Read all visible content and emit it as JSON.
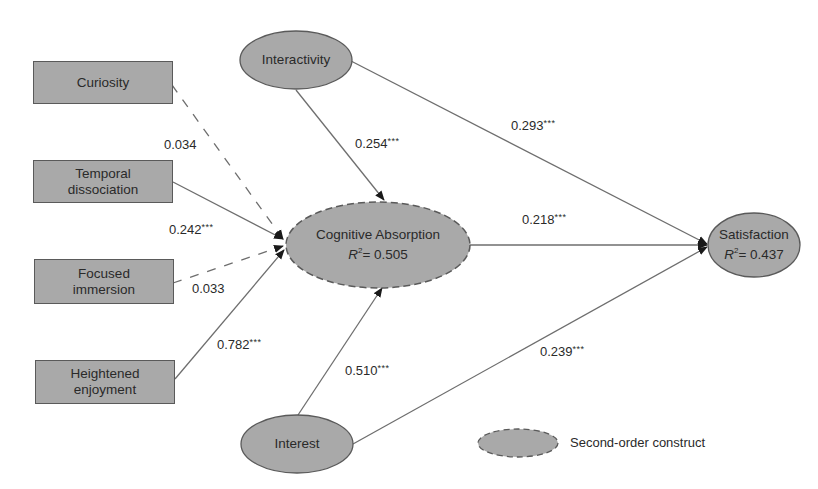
{
  "figure": {
    "type": "structural path model",
    "colors": {
      "node_fill": "#a9a9a9",
      "node_stroke": "#5a5a5a",
      "path_line": "#6e6e6e",
      "arrowhead": "#1a1a1a",
      "text": "#2a2a2a"
    }
  },
  "nodes": {
    "curiosity": {
      "label": "Curiosity",
      "shape": "rectangle"
    },
    "temporal_dissociation": {
      "line1": "Temporal",
      "line2": "dissociation",
      "shape": "rectangle"
    },
    "focused_immersion": {
      "line1": "Focused",
      "line2": "immersion",
      "shape": "rectangle"
    },
    "heightened_enjoyment": {
      "line1": "Heightened",
      "line2": "enjoyment",
      "shape": "rectangle"
    },
    "interactivity": {
      "label": "Interactivity",
      "shape": "ellipse"
    },
    "interest": {
      "label": "Interest",
      "shape": "ellipse"
    },
    "cognitive_absorption": {
      "label": "Cognitive Absorption",
      "r2_symbol": "R",
      "r2_exp": "2",
      "r2_value": "= 0.505",
      "shape": "ellipse",
      "style": "dashed (second-order construct)"
    },
    "satisfaction": {
      "label": "Satisfaction",
      "r2_symbol": "R",
      "r2_exp": "2",
      "r2_value": "= 0.437",
      "shape": "ellipse"
    }
  },
  "paths": [
    {
      "from": "Curiosity",
      "to": "Cognitive Absorption",
      "coef": "0.034",
      "sig": "",
      "line": "dashed"
    },
    {
      "from": "Temporal dissociation",
      "to": "Cognitive Absorption",
      "coef": "0.242",
      "sig": "***",
      "line": "solid"
    },
    {
      "from": "Focused immersion",
      "to": "Cognitive Absorption",
      "coef": "0.033",
      "sig": "",
      "line": "dashed"
    },
    {
      "from": "Heightened enjoyment",
      "to": "Cognitive Absorption",
      "coef": "0.782",
      "sig": "***",
      "line": "solid"
    },
    {
      "from": "Interactivity",
      "to": "Cognitive Absorption",
      "coef": "0.254",
      "sig": "***",
      "line": "solid"
    },
    {
      "from": "Interest",
      "to": "Cognitive Absorption",
      "coef": "0.510",
      "sig": "***",
      "line": "solid"
    },
    {
      "from": "Interactivity",
      "to": "Satisfaction",
      "coef": "0.293",
      "sig": "***",
      "line": "solid"
    },
    {
      "from": "Cognitive Absorption",
      "to": "Satisfaction",
      "coef": "0.218",
      "sig": "***",
      "line": "solid"
    },
    {
      "from": "Interest",
      "to": "Satisfaction",
      "coef": "0.239",
      "sig": "***",
      "line": "solid"
    }
  ],
  "legend": {
    "label": "Second-order construct",
    "symbol": "dashed-outline ellipse"
  }
}
